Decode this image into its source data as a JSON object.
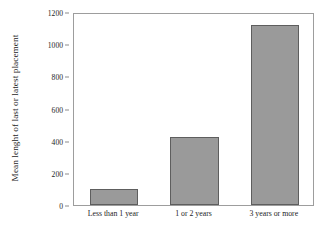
{
  "chart_data": {
    "type": "bar",
    "title": "",
    "subtitle": "",
    "xlabel": "",
    "ylabel": "Mean lenght of last or latest placement",
    "categories": [
      "Less than 1 year",
      "1 or 2 years",
      "3 years or more"
    ],
    "values": [
      100,
      425,
      1120
    ],
    "series": [
      {
        "name": "Mean lenght of last or latest placement",
        "values": [
          100,
          425,
          1120
        ]
      }
    ],
    "ylim": [
      0,
      1200
    ],
    "y_ticks": [
      0,
      200,
      400,
      600,
      800,
      1000,
      1200
    ],
    "y_tick_labels": [
      "0",
      "200",
      "400",
      "600",
      "800",
      "1000",
      "1200"
    ],
    "grid": false,
    "legend": "none",
    "bar_color": "#9a9a9a",
    "bar_border_color": "#5e5e5e",
    "frame_color": "#9d9d9d",
    "background_color": "#ffffff",
    "text_color": "#1d1d1d"
  }
}
